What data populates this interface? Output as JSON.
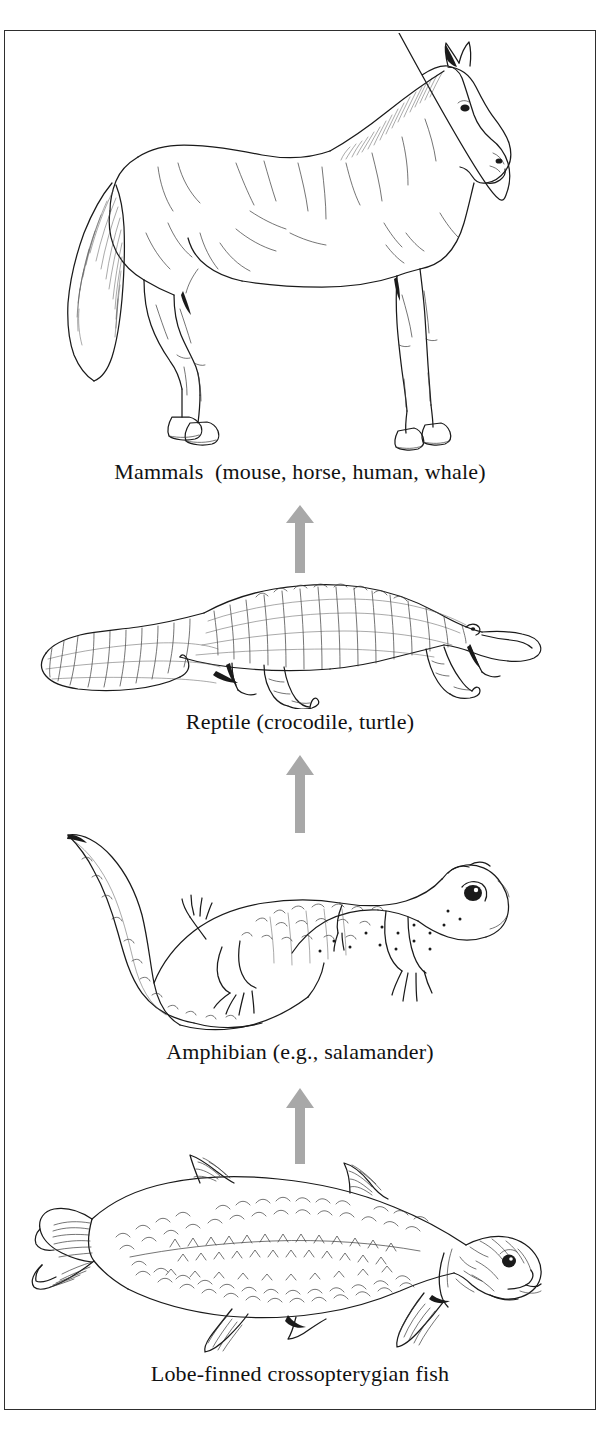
{
  "figure": {
    "kind": "evolutionary-sequence-diagram",
    "orientation": "vertical, bottom to top",
    "border_color": "#2e2e2e",
    "background_color": "#ffffff",
    "arrow_color": "#a8a8a8",
    "ink_color": "#1a1a1a"
  },
  "levels": [
    {
      "id": "mammals",
      "order": 4,
      "caption": "Mammals  (mouse, horse, human, whale)",
      "illustration": "horse-line-drawing",
      "illustration_alt": "Side view line drawing of a standing horse facing right"
    },
    {
      "id": "reptile",
      "order": 3,
      "caption": "Reptile (crocodile, turtle)",
      "illustration": "crocodile-line-drawing",
      "illustration_alt": "Side view line drawing of a crocodile facing right"
    },
    {
      "id": "amphibian",
      "order": 2,
      "caption": "Amphibian (e.g., salamander)",
      "illustration": "salamander-line-drawing",
      "illustration_alt": "Line drawing of a salamander with curved tail facing right"
    },
    {
      "id": "fish",
      "order": 1,
      "caption": "Lobe-finned crossopterygian fish",
      "illustration": "coelacanth-line-drawing",
      "illustration_alt": "Line drawing of a lobe-finned crossopterygian fish facing right"
    }
  ],
  "arrows": [
    {
      "id": "arrow-reptile-to-mammals",
      "from": "reptile",
      "to": "mammals",
      "direction": "up"
    },
    {
      "id": "arrow-amphibian-to-reptile",
      "from": "amphibian",
      "to": "reptile",
      "direction": "up"
    },
    {
      "id": "arrow-fish-to-amphibian",
      "from": "fish",
      "to": "amphibian",
      "direction": "up"
    }
  ]
}
